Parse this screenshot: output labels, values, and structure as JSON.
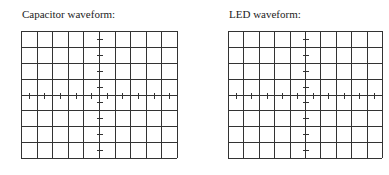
{
  "panels": [
    {
      "id": "capacitor",
      "label": "Capacitor waveform:",
      "grid": {
        "columns": 10,
        "rows": 8,
        "x": 21,
        "y": 31,
        "width": 156,
        "height": 127
      }
    },
    {
      "id": "led",
      "label": "LED waveform:",
      "grid": {
        "columns": 10,
        "rows": 8,
        "x": 228,
        "y": 31,
        "width": 154,
        "height": 127
      }
    }
  ],
  "style": {
    "grid_color": "#333333",
    "text_color": "#222222",
    "background": "#ffffff"
  }
}
